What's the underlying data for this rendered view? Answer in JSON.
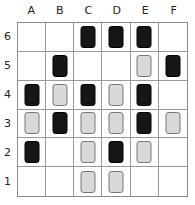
{
  "columns": [
    "A",
    "B",
    "C",
    "D",
    "E",
    "F"
  ],
  "rows": [
    "6",
    "5",
    "4",
    "3",
    "2",
    "1"
  ],
  "grid": [
    [
      "",
      "",
      "black",
      "black",
      "black",
      ""
    ],
    [
      "",
      "black",
      "",
      "",
      "gray",
      "black"
    ],
    [
      "black",
      "gray",
      "black",
      "gray",
      "black",
      ""
    ],
    [
      "gray",
      "black",
      "gray",
      "gray",
      "black",
      "gray"
    ],
    [
      "black",
      "",
      "gray",
      "black",
      "gray",
      ""
    ],
    [
      "",
      "",
      "gray",
      "gray",
      "",
      ""
    ]
  ],
  "colors": {
    "black": "#161616",
    "gray": "#d8d8d8",
    "grid_line": "#999999"
  }
}
